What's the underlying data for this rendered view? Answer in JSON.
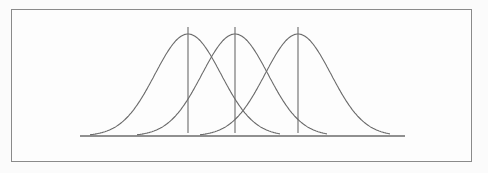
{
  "diagram": {
    "colors": {
      "stroke": "#6b6b6b",
      "frame": "#8a8a8a",
      "background": "#fdfdfd"
    },
    "baseline": {
      "x1": 80,
      "x2": 405,
      "y": 136
    },
    "curves": [
      {
        "id": "curve-1",
        "mean_x": 188,
        "peak_y": 34,
        "sigma_px": 33,
        "x_start": 90,
        "x_end": 280
      },
      {
        "id": "curve-2",
        "mean_x": 235,
        "peak_y": 34,
        "sigma_px": 33,
        "x_start": 137,
        "x_end": 327
      },
      {
        "id": "curve-3",
        "mean_x": 298,
        "peak_y": 34,
        "sigma_px": 33,
        "x_start": 200,
        "x_end": 390
      }
    ],
    "mean_lines": [
      {
        "x": 188,
        "y1": 27,
        "y2": 133
      },
      {
        "x": 235,
        "y1": 27,
        "y2": 133
      },
      {
        "x": 298,
        "y1": 27,
        "y2": 133
      }
    ]
  }
}
